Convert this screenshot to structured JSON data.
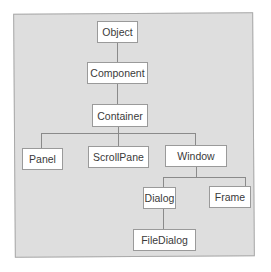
{
  "diagram": {
    "type": "class-hierarchy",
    "nodes": {
      "object": "Object",
      "component": "Component",
      "container": "Container",
      "panel": "Panel",
      "scrollpane": "ScrollPane",
      "window": "Window",
      "dialog": "Dialog",
      "frame": "Frame",
      "filedialog": "FileDialog"
    },
    "edges": [
      [
        "Object",
        "Component"
      ],
      [
        "Component",
        "Container"
      ],
      [
        "Container",
        "Panel"
      ],
      [
        "Container",
        "ScrollPane"
      ],
      [
        "Container",
        "Window"
      ],
      [
        "Window",
        "Dialog"
      ],
      [
        "Window",
        "Frame"
      ],
      [
        "Dialog",
        "FileDialog"
      ]
    ],
    "colors": {
      "background": "#dedede",
      "node_fill": "#ffffff",
      "line": "#8a8a8a"
    }
  }
}
